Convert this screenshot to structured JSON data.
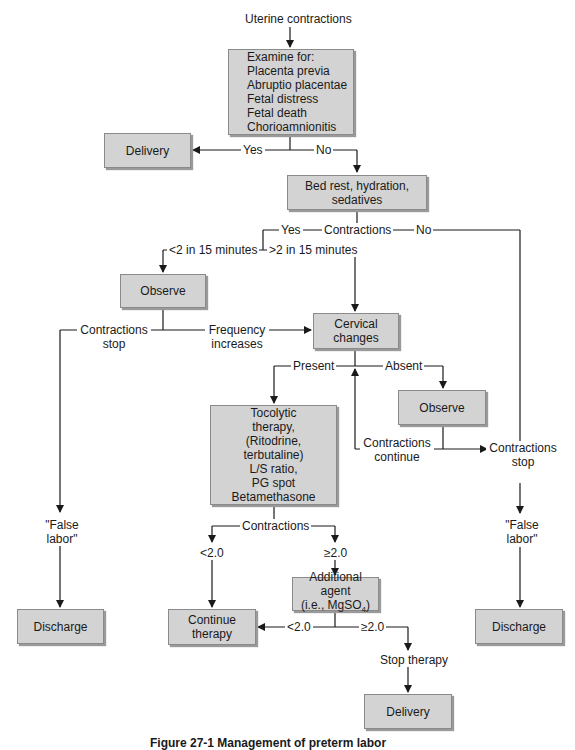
{
  "diagram": {
    "start_label": "Uterine contractions",
    "nodes": {
      "examine": {
        "lines": [
          "Examine for:",
          "Placenta previa",
          "Abruptio placentae",
          "Fetal distress",
          "Fetal death",
          "Chorioamnionitis"
        ]
      },
      "delivery_top": {
        "lines": [
          "Delivery"
        ]
      },
      "bed_rest": {
        "lines": [
          "Bed rest, hydration, sedatives"
        ]
      },
      "observe_left": {
        "lines": [
          "Observe"
        ]
      },
      "cervical_changes": {
        "lines": [
          "Cervical",
          "changes"
        ]
      },
      "observe_right": {
        "lines": [
          "Observe"
        ]
      },
      "tocolytic": {
        "lines": [
          "Tocolytic",
          "therapy,",
          "(Ritodrine,",
          "terbutaline)",
          "L/S ratio,",
          "PG spot",
          "Betamethasone"
        ]
      },
      "additional_agent": {
        "lines": [
          "Additional agent",
          "(i.e., MgSO",
          "4",
          ")"
        ]
      },
      "continue_therapy": {
        "lines": [
          "Continue",
          "therapy"
        ]
      },
      "discharge_left": {
        "lines": [
          "Discharge"
        ]
      },
      "discharge_right": {
        "lines": [
          "Discharge"
        ]
      },
      "delivery_bottom": {
        "lines": [
          "Delivery"
        ]
      }
    },
    "edge_labels": {
      "yes_1": "Yes",
      "no_1": "No",
      "yes_2": "Yes",
      "contractions_1": "Contractions",
      "no_2": "No",
      "lt2_15": "<2 in 15 minutes",
      "gt2_15": ">2 in 15 minutes",
      "contractions_stop_left": [
        "Contractions",
        "stop"
      ],
      "frequency_increases": [
        "Frequency",
        "increases"
      ],
      "present": "Present",
      "absent": "Absent",
      "contractions_continue": [
        "Contractions",
        "continue"
      ],
      "contractions_stop_right": [
        "Contractions",
        "stop"
      ],
      "false_labor_left": [
        "\"False",
        "labor\""
      ],
      "false_labor_right": [
        "\"False",
        "labor\""
      ],
      "contractions_2": "Contractions",
      "lt2_0_a": "<2.0",
      "ge2_0_a": "≥2.0",
      "lt2_0_b": "<2.0",
      "ge2_0_b": "≥2.0",
      "stop_therapy": "Stop therapy"
    },
    "caption": "Figure 27-1  Management of preterm labor"
  },
  "colors": {
    "box_fill": "#d3d3d3",
    "box_border": "#8a8a8a",
    "line": "#1a1a1a"
  }
}
